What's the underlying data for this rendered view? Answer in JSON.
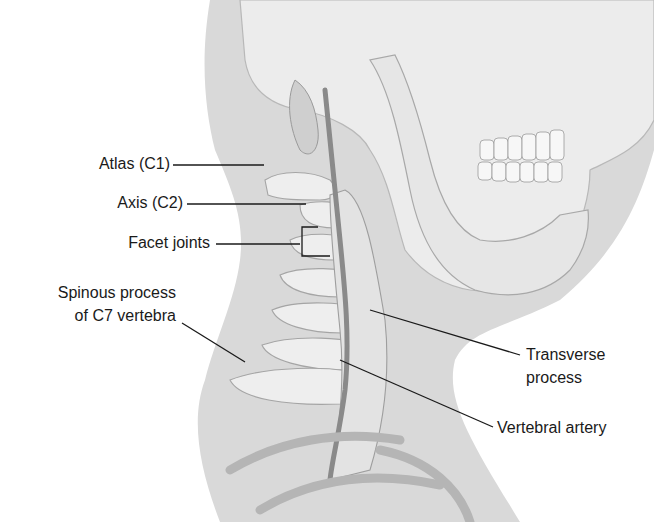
{
  "figure": {
    "colors": {
      "background": "#ffffff",
      "neck_silhouette": "#d9d9d9",
      "bone": "#eeeeee",
      "bone_shadow": "#bdbdbd",
      "artery": "#8a8a8a",
      "leader_line": "#1a1a1a",
      "text": "#1a1a1a"
    }
  },
  "labels": {
    "atlas": "Atlas (C1)",
    "axis": "Axis (C2)",
    "facet_joints": "Facet joints",
    "spinous_process_line1": "Spinous process",
    "spinous_process_line2": "of C7 vertebra",
    "transverse_process_line1": "Transverse",
    "transverse_process_line2": "process",
    "vertebral_artery": "Vertebral artery"
  }
}
